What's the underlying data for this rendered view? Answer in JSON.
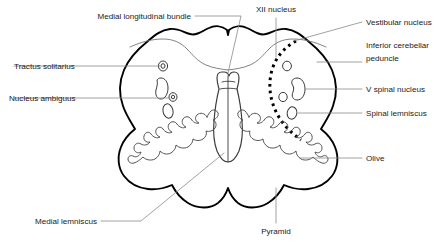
{
  "figure": {
    "type": "anatomical-diagram",
    "background_color": "#ffffff",
    "outline_color": "#000000",
    "leader_color": "#8a8a8a"
  },
  "labels": {
    "medial_longitudinal_bundle": "Medial longitudinal bundle",
    "xii_nucleus": "XII nucleus",
    "vestibular_nucleus": "Vestibular nucleus",
    "inferior_cerebellar_peduncle_line1": "Inferior cerebellar",
    "inferior_cerebellar_peduncle_line2": "peduncle",
    "tractus_solitarius": "Tractus solitarius",
    "v_spinal_nucleus": "V spinal nucleus",
    "nucleus_ambiguus": "Nucleus ambiguus",
    "spinal_lemniscus": "Spinal lemniscus",
    "olive": "Olive",
    "medial_lemniscus": "Medial lemniscus",
    "pyramid": "Pyramid"
  },
  "structures": {
    "silhouette": "butterfly-shaped medulla cross-section",
    "central_flask": "XII nucleus / midline flask structure",
    "dashed_boundary": "spinal trigeminal tract dashed arc",
    "olive_left": "left inferior olivary nucleus convoluted ribbon",
    "olive_right": "right inferior olivary nucleus convoluted ribbon",
    "left_nuclei_count": 4,
    "right_nuclei_count": 4
  }
}
